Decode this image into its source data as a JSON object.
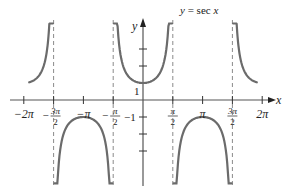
{
  "chart_data": {
    "type": "line",
    "title": "y = sec x",
    "xlabel": "x",
    "ylabel": "y",
    "function": "sec(x)",
    "xlim": [
      -6.6,
      7.0
    ],
    "ylim": [
      -3.5,
      4.5
    ],
    "grid": false,
    "x_ticks": [
      "-2π",
      "-3π/2",
      "-π",
      "-π/2",
      "π/2",
      "π",
      "3π/2",
      "2π"
    ],
    "x_tick_values": [
      -6.2832,
      -4.7124,
      -3.1416,
      -1.5708,
      1.5708,
      3.1416,
      4.7124,
      6.2832
    ],
    "y_ticks": [
      "1",
      "-1"
    ],
    "y_tick_values": [
      1,
      -1
    ],
    "unlabeled_y_ticks": [
      2,
      3,
      -2,
      -3
    ],
    "asymptotes": [
      "-3π/2",
      "-π/2",
      "π/2",
      "3π/2"
    ],
    "asymptote_values": [
      -4.7124,
      -1.5708,
      1.5708,
      4.7124
    ],
    "series": [
      {
        "name": "sec x",
        "branches": [
          {
            "x_range": [
              -6.0,
              -4.75
            ],
            "sign": "positive",
            "min_point": null
          },
          {
            "x_range": [
              -4.67,
              -1.61
            ],
            "sign": "negative",
            "max_point": [
              -3.1416,
              -1
            ]
          },
          {
            "x_range": [
              -1.53,
              1.53
            ],
            "sign": "positive",
            "min_point": [
              0,
              1
            ]
          },
          {
            "x_range": [
              1.61,
              4.67
            ],
            "sign": "negative",
            "max_point": [
              3.1416,
              -1
            ]
          },
          {
            "x_range": [
              4.75,
              6.0
            ],
            "sign": "positive",
            "min_point": null
          }
        ]
      }
    ],
    "colors": {
      "curve": "#6b6b6b",
      "axis": "#555555",
      "asymptote": "#8a8a8a"
    }
  },
  "labels": {
    "title": "y = sec x",
    "y_axis": "y",
    "x_axis": "x",
    "one": "1",
    "neg_one": "−1"
  }
}
